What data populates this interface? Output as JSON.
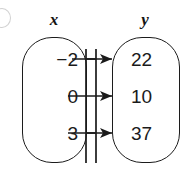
{
  "diagram": {
    "type": "mapping-diagram",
    "corner_marker": "partial-circle-label",
    "sets": {
      "domain": {
        "label": "x",
        "values": [
          "−2",
          "0",
          "3"
        ]
      },
      "range": {
        "label": "y",
        "values": [
          "22",
          "10",
          "37"
        ]
      }
    },
    "mappings": [
      {
        "from": "−2",
        "to": "22"
      },
      {
        "from": "0",
        "to": "10"
      },
      {
        "from": "3",
        "to": "37"
      }
    ],
    "colors": {
      "stroke": "#1a1a1a",
      "text": "#1a1a1a",
      "background": "#ffffff"
    }
  }
}
